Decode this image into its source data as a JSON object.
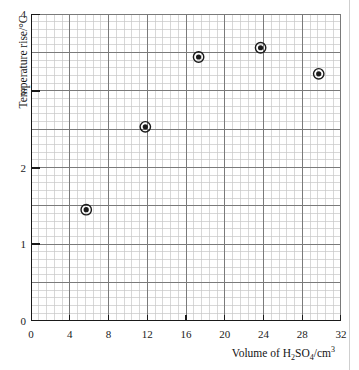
{
  "chart_data": {
    "type": "scatter",
    "title": "",
    "xlabel": "Volume of H2SO4/cm3",
    "xlabel_html": "Volume of H<sub>2</sub>SO<sub>4</sub>/cm<sup>3</sup>",
    "ylabel": "Temperature rise/°C",
    "xlim": [
      0,
      32
    ],
    "ylim": [
      0,
      4
    ],
    "x_major_tick": 4,
    "y_major_tick": 1,
    "x_gridline_major_step": 4,
    "y_gridline_major_step": 0.5,
    "x_gridline_minor_step": 0.8,
    "y_gridline_minor_step": 0.1,
    "grid": true,
    "legend": null,
    "x_ticks": [
      "0",
      "4",
      "8",
      "12",
      "16",
      "20",
      "24",
      "28",
      "32"
    ],
    "x_tick_values": [
      0,
      4,
      8,
      12,
      16,
      20,
      24,
      28,
      32
    ],
    "y_ticks": [
      "0",
      "1",
      "2",
      "3",
      "4"
    ],
    "y_tick_values": [
      0,
      1,
      2,
      3,
      4
    ],
    "marker": "circle-with-ring",
    "marker_color": "#1a1a1a",
    "points": [
      {
        "x": 5.7,
        "y": 1.45
      },
      {
        "x": 11.8,
        "y": 2.53
      },
      {
        "x": 17.3,
        "y": 3.44
      },
      {
        "x": 23.7,
        "y": 3.56
      },
      {
        "x": 29.7,
        "y": 3.22
      }
    ],
    "series": [
      {
        "name": "Temperature rise vs volume of sulfuric acid",
        "x": [
          5.7,
          11.8,
          17.3,
          23.7,
          29.7
        ],
        "values": [
          1.45,
          2.53,
          3.44,
          3.56,
          3.22
        ]
      }
    ]
  },
  "colors": {
    "axis": "#1a1a1a",
    "grid_major": "#7a7a7a",
    "grid_minor": "#c8c8c8",
    "marker": "#1a1a1a",
    "background": "#ffffff",
    "page_edge": "#cfcfcf"
  }
}
